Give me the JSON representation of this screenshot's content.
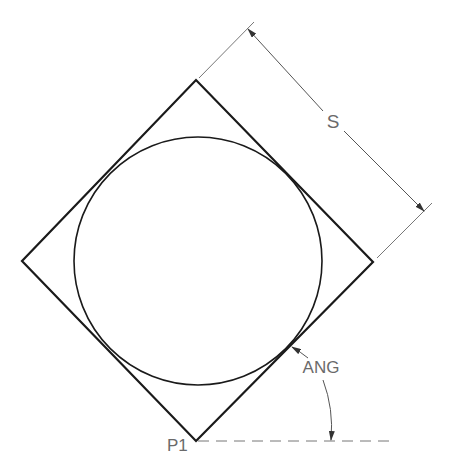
{
  "diagram": {
    "type": "technical-drawing",
    "colors": {
      "geometry": "#1a1a1a",
      "annotation": "#6a6a6a",
      "background": "#ffffff"
    },
    "labels": {
      "side_dimension": "S",
      "angle": "ANG",
      "base_point": "P1"
    },
    "square": {
      "corners": [
        [
          196,
          441
        ],
        [
          373,
          262
        ],
        [
          196,
          80
        ],
        [
          22,
          261
        ]
      ]
    },
    "circle": {
      "cx": 198,
      "cy": 261,
      "r": 124
    }
  }
}
